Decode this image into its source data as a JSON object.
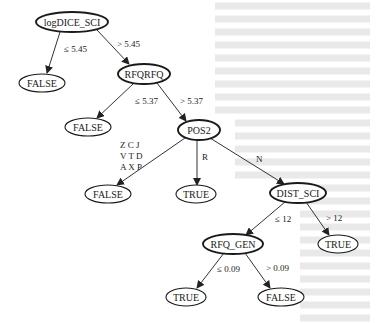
{
  "diagram": {
    "type": "decision-tree",
    "background": "#ffffff",
    "line_color": "#333333",
    "nodes": [
      {
        "id": "n_root",
        "label": "logDICE_SCI",
        "kind": "internal",
        "cx": 72,
        "cy": 22,
        "rx": 36,
        "ry": 10
      },
      {
        "id": "n_false1",
        "label": "FALSE",
        "kind": "leaf",
        "cx": 42,
        "cy": 83,
        "rx": 23,
        "ry": 9
      },
      {
        "id": "n_rfqrfq",
        "label": "RFQRFQ",
        "kind": "internal",
        "cx": 144,
        "cy": 74,
        "rx": 26,
        "ry": 10
      },
      {
        "id": "n_false2",
        "label": "FALSE",
        "kind": "leaf",
        "cx": 88,
        "cy": 127,
        "rx": 23,
        "ry": 9
      },
      {
        "id": "n_pos2",
        "label": "POS2",
        "kind": "internal",
        "cx": 199,
        "cy": 130,
        "rx": 21,
        "ry": 10
      },
      {
        "id": "n_false3",
        "label": "FALSE",
        "kind": "leaf",
        "cx": 108,
        "cy": 194,
        "rx": 23,
        "ry": 9
      },
      {
        "id": "n_true1",
        "label": "TRUE",
        "kind": "leaf",
        "cx": 196,
        "cy": 194,
        "rx": 20,
        "ry": 9
      },
      {
        "id": "n_dist",
        "label": "DIST_SCI",
        "kind": "internal",
        "cx": 298,
        "cy": 193,
        "rx": 28,
        "ry": 10
      },
      {
        "id": "n_rfqgen",
        "label": "RFQ_GEN",
        "kind": "internal",
        "cx": 233,
        "cy": 244,
        "rx": 30,
        "ry": 10
      },
      {
        "id": "n_true2",
        "label": "TRUE",
        "kind": "leaf",
        "cx": 338,
        "cy": 244,
        "rx": 20,
        "ry": 9
      },
      {
        "id": "n_true3",
        "label": "TRUE",
        "kind": "leaf",
        "cx": 186,
        "cy": 297,
        "rx": 20,
        "ry": 9
      },
      {
        "id": "n_false4",
        "label": "FALSE",
        "kind": "leaf",
        "cx": 281,
        "cy": 297,
        "rx": 23,
        "ry": 9
      }
    ],
    "edges": [
      {
        "from": "n_root",
        "to": "n_false1",
        "label": [
          "≤ 5.45"
        ],
        "x1": 60,
        "y1": 32,
        "x2": 47,
        "y2": 73,
        "lx": 64,
        "ly": 52
      },
      {
        "from": "n_root",
        "to": "n_rfqrfq",
        "label": [
          "> 5.45"
        ],
        "x1": 97,
        "y1": 30,
        "x2": 129,
        "y2": 64,
        "lx": 117,
        "ly": 47
      },
      {
        "from": "n_rfqrfq",
        "to": "n_false2",
        "label": [
          "≤ 5.37"
        ],
        "x1": 133,
        "y1": 84,
        "x2": 97,
        "y2": 118,
        "lx": 135,
        "ly": 104
      },
      {
        "from": "n_rfqrfq",
        "to": "n_pos2",
        "label": [
          "> 5.37"
        ],
        "x1": 157,
        "y1": 83,
        "x2": 186,
        "y2": 121,
        "lx": 180,
        "ly": 104
      },
      {
        "from": "n_pos2",
        "to": "n_false3",
        "label": [
          "Z C J",
          "V T D",
          "A X P"
        ],
        "x1": 185,
        "y1": 138,
        "x2": 117,
        "y2": 185,
        "lx": 120,
        "ly": 148
      },
      {
        "from": "n_pos2",
        "to": "n_true1",
        "label": [
          "R"
        ],
        "x1": 197,
        "y1": 140,
        "x2": 197,
        "y2": 185,
        "lx": 202,
        "ly": 160
      },
      {
        "from": "n_pos2",
        "to": "n_dist",
        "label": [
          "N"
        ],
        "x1": 210,
        "y1": 138,
        "x2": 284,
        "y2": 184,
        "lx": 256,
        "ly": 162
      },
      {
        "from": "n_dist",
        "to": "n_rfqgen",
        "label": [
          "≤ 12"
        ],
        "x1": 285,
        "y1": 202,
        "x2": 246,
        "y2": 235,
        "lx": 275,
        "ly": 222
      },
      {
        "from": "n_dist",
        "to": "n_true2",
        "label": [
          "> 12"
        ],
        "x1": 306,
        "y1": 202,
        "x2": 329,
        "y2": 235,
        "lx": 326,
        "ly": 221
      },
      {
        "from": "n_rfqgen",
        "to": "n_true3",
        "label": [
          "≤ 0.09"
        ],
        "x1": 224,
        "y1": 253,
        "x2": 197,
        "y2": 288,
        "lx": 217,
        "ly": 272
      },
      {
        "from": "n_rfqgen",
        "to": "n_false4",
        "label": [
          "> 0.09"
        ],
        "x1": 245,
        "y1": 253,
        "x2": 270,
        "y2": 288,
        "lx": 266,
        "ly": 271
      }
    ]
  }
}
